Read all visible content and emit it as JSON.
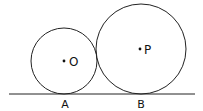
{
  "diagram": {
    "type": "geometry",
    "colors": {
      "stroke": "#222222",
      "text": "#111111",
      "background": "#ffffff"
    },
    "line": {
      "x1": 9,
      "y1": 94,
      "x2": 195,
      "y2": 94
    },
    "circles": [
      {
        "id": "O",
        "cx": 64,
        "cy": 61,
        "r": 33,
        "center_label": "O",
        "tangent_point_label": "A"
      },
      {
        "id": "P",
        "cx": 141,
        "cy": 49,
        "r": 45,
        "center_label": "P",
        "tangent_point_label": "B"
      }
    ],
    "labels": {
      "O": "O",
      "P": "P",
      "A": "A",
      "B": "B"
    }
  }
}
